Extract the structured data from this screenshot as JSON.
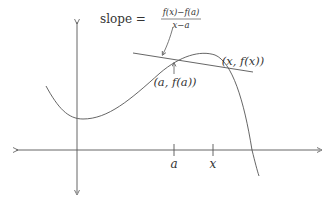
{
  "diagram": {
    "type": "secant-line-illustration",
    "colors": {
      "stroke": "#555555",
      "text": "#333333",
      "background": "#ffffff"
    },
    "slope_label": {
      "prefix": "slope =",
      "numerator": "f(x)−f(a)",
      "denominator": "x−a"
    },
    "point_labels": {
      "a_point": "(a, f(a))",
      "x_point": "(x, f(x))"
    },
    "axis_labels": {
      "a_tick": "a",
      "x_tick": "x"
    }
  }
}
